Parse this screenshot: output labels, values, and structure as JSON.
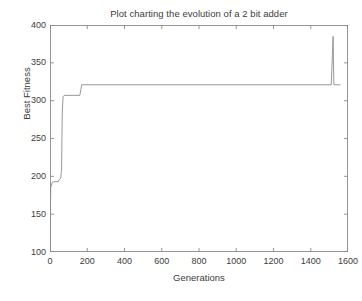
{
  "chart_data": {
    "type": "line",
    "title": "Plot charting the evolution of a 2 bit adder",
    "xlabel": "Generations",
    "ylabel": "Best Fitness",
    "xlim": [
      0,
      1600
    ],
    "ylim": [
      100,
      400
    ],
    "xticks": [
      0,
      200,
      400,
      600,
      800,
      1000,
      1200,
      1400,
      1600
    ],
    "yticks": [
      100,
      150,
      200,
      250,
      300,
      350,
      400
    ],
    "grid": false,
    "legend": null,
    "line_color": "#8c8c8c",
    "axis_color": "#8a8a8a",
    "background_color": "#ffffff",
    "series": [
      {
        "name": "Best Fitness",
        "x": [
          0,
          2,
          4,
          12,
          20,
          44,
          50,
          52,
          58,
          60,
          62,
          64,
          66,
          70,
          76,
          160,
          166,
          170,
          1510,
          1516,
          1520,
          1524,
          1560
        ],
        "values": [
          100,
          150,
          185,
          192,
          193,
          193,
          196,
          196,
          198,
          205,
          206,
          250,
          285,
          305,
          307,
          307,
          315,
          321,
          321,
          360,
          385,
          321,
          321
        ]
      }
    ],
    "annotations": [
      "Monotonic step increase from 100 at generation 0",
      "First plateau near 193-196 from about generation 12 to 58",
      "Rapid rise around generation 60-70 to about 307",
      "Step up to 321 near generation 170",
      "Long plateau at 321 until about generation 1510",
      "Narrow spike to about 385 near generation 1520, returning to 321"
    ]
  }
}
